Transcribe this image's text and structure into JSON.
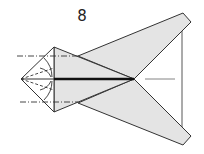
{
  "diagram": {
    "step_number": "8",
    "colors": {
      "paper_fill": "#e4e4e4",
      "line": "#333333",
      "thick_line": "#111111",
      "background": "#ffffff"
    }
  }
}
